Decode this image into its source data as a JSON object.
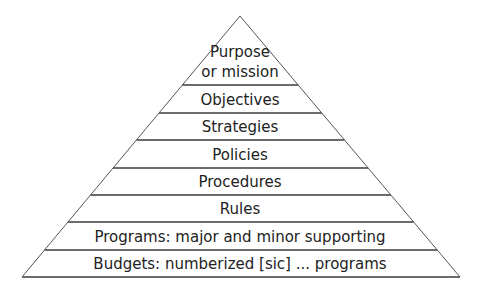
{
  "diagram": {
    "type": "pyramid",
    "apex": {
      "x": 240,
      "y": 16
    },
    "base": {
      "y": 277,
      "left_x": 22,
      "right_x": 460
    },
    "line_color": "#3a3a3a",
    "edge_color": "#555555",
    "text_color": "#222222",
    "tiers": [
      {
        "label_lines": [
          "Purpose",
          "or mission"
        ],
        "top_y": 16,
        "bottom_y": 85
      },
      {
        "label_lines": [
          "Objectives"
        ],
        "top_y": 85,
        "bottom_y": 113
      },
      {
        "label_lines": [
          "Strategies"
        ],
        "top_y": 113,
        "bottom_y": 140
      },
      {
        "label_lines": [
          "Policies"
        ],
        "top_y": 140,
        "bottom_y": 168
      },
      {
        "label_lines": [
          "Procedures"
        ],
        "top_y": 168,
        "bottom_y": 195
      },
      {
        "label_lines": [
          "Rules"
        ],
        "top_y": 195,
        "bottom_y": 222
      },
      {
        "label_lines": [
          "Programs: major and minor supporting"
        ],
        "top_y": 222,
        "bottom_y": 250
      },
      {
        "label_lines": [
          "Budgets: numberized [sic] ... programs"
        ],
        "top_y": 250,
        "bottom_y": 277
      }
    ]
  }
}
